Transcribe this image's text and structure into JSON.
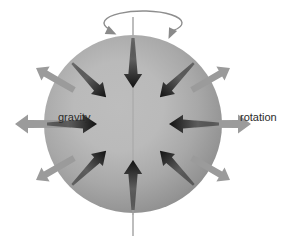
{
  "figure": {
    "name": "gravity-rotation-sphere-diagram",
    "width": 286,
    "height": 241,
    "background_color": "#ffffff"
  },
  "sphere": {
    "name": "planet-sphere",
    "center_x": 133,
    "center_y": 124,
    "radius": 89,
    "center_color": "#bdbdbd",
    "mid_color": "#a8a8a8",
    "edge_color": "#7f7f7f",
    "highlight_offset_x": -18,
    "highlight_offset_y": -14
  },
  "axis": {
    "name": "rotation-axis-line",
    "color": "#9a9a9a",
    "width": 1.3,
    "x": 133,
    "y_top": 17,
    "y_bottom": 236
  },
  "spin_arc": {
    "name": "rotation-spin-arc",
    "color": "#8e8e8e",
    "stroke_width": 1.4,
    "center_x": 143,
    "center_y": 23,
    "radius_x": 39,
    "radius_y": 12,
    "arrowhead_color": "#8a8a8a"
  },
  "colors": {
    "gravity_arrow": "#111111",
    "gravity_arrow_fade": "#5a5a5a",
    "rotation_arrow": "#9b9b9b",
    "rotation_arrow_light": "#ababab",
    "label": "#2b2b2b",
    "sphere_outline": "none"
  },
  "labels": {
    "gravity": "gravity",
    "rotation": "rotation",
    "gravity_x": 58,
    "gravity_y": 121,
    "rotation_x": 240,
    "rotation_y": 121
  },
  "gravity_arrows": {
    "name": "gravity-inward-arrows",
    "label": "gravity",
    "direction": "inward",
    "color": "#111111",
    "count": 8,
    "items": [
      {
        "name": "gravity-arrow-north",
        "angle_deg": 270,
        "tail_r": 86,
        "head_r": 36
      },
      {
        "name": "gravity-arrow-northeast",
        "angle_deg": 315,
        "tail_r": 86,
        "head_r": 38
      },
      {
        "name": "gravity-arrow-east",
        "angle_deg": 0,
        "tail_r": 86,
        "head_r": 36
      },
      {
        "name": "gravity-arrow-southeast",
        "angle_deg": 45,
        "tail_r": 86,
        "head_r": 38
      },
      {
        "name": "gravity-arrow-south",
        "angle_deg": 90,
        "tail_r": 86,
        "head_r": 36
      },
      {
        "name": "gravity-arrow-southwest",
        "angle_deg": 135,
        "tail_r": 86,
        "head_r": 38
      },
      {
        "name": "gravity-arrow-west",
        "angle_deg": 180,
        "tail_r": 86,
        "head_r": 36
      },
      {
        "name": "gravity-arrow-northwest",
        "angle_deg": 225,
        "tail_r": 86,
        "head_r": 38
      }
    ]
  },
  "rotation_arrows": {
    "name": "rotation-outward-arrows",
    "label": "rotation",
    "direction": "outward",
    "color": "#9b9b9b",
    "count": 6,
    "items": [
      {
        "name": "rotation-arrow-east",
        "angle_deg": 0,
        "tail_r": 62,
        "head_r": 118
      },
      {
        "name": "rotation-arrow-west",
        "angle_deg": 180,
        "tail_r": 62,
        "head_r": 118
      },
      {
        "name": "rotation-arrow-northeast",
        "angle_deg": 330,
        "tail_r": 68,
        "head_r": 112
      },
      {
        "name": "rotation-arrow-northwest",
        "angle_deg": 210,
        "tail_r": 68,
        "head_r": 112
      },
      {
        "name": "rotation-arrow-southeast",
        "angle_deg": 30,
        "tail_r": 68,
        "head_r": 112
      },
      {
        "name": "rotation-arrow-southwest",
        "angle_deg": 150,
        "tail_r": 68,
        "head_r": 112
      }
    ]
  }
}
